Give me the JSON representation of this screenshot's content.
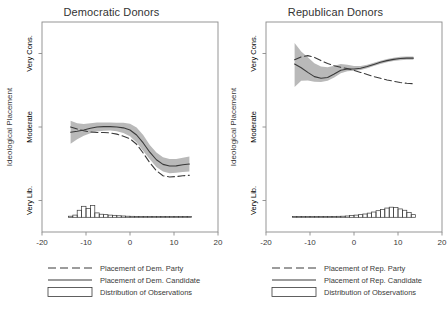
{
  "figure": {
    "background": "#ffffff",
    "band_color": "#b9b9b9",
    "line_color": "#3a3a3a",
    "frame_color": "#8a8a8a"
  },
  "panels": [
    {
      "id": "democratic",
      "title": "Democratic Donors",
      "legend": {
        "party_label": "Placement of Dem. Party",
        "candidate_label": "Placement of Dem. Candidate",
        "distribution_label": "Distribution of Observations"
      }
    },
    {
      "id": "republican",
      "title": "Republican Donors",
      "legend": {
        "party_label": "Placement of Rep. Party",
        "candidate_label": "Placement of Rep. Candidate",
        "distribution_label": "Distribution of Observations"
      }
    }
  ],
  "chart_data": [
    {
      "type": "line",
      "title": "Democratic Donors",
      "xlabel": "",
      "ylabel": "Ideological Placement",
      "xlim": [
        -20,
        20
      ],
      "xticks": [
        -20,
        -10,
        0,
        10,
        20
      ],
      "xticklabels": [
        "-20",
        "-10",
        "0",
        "10",
        "20"
      ],
      "ylim": [
        0,
        100
      ],
      "yticks": [
        85,
        50,
        15
      ],
      "yticklabels": [
        "Very Cons.",
        "Moderate",
        "Very Lib."
      ],
      "grid": false,
      "legend_position": "below",
      "series": [
        {
          "name": "Placement of Dem. Candidate",
          "style": "solid",
          "x": [
            -13.5,
            -12,
            -10.5,
            -9,
            -7.5,
            -6,
            -4.5,
            -3,
            -1.5,
            0,
            1.5,
            3,
            4.5,
            6,
            7.5,
            9,
            10.5,
            12,
            13.5
          ],
          "y": [
            47.5,
            48.0,
            48.6,
            49.4,
            50.0,
            50.2,
            50.2,
            50.0,
            49.6,
            48.6,
            46.2,
            42.4,
            38.0,
            34.4,
            32.2,
            31.4,
            31.5,
            32.0,
            32.4
          ],
          "ci_lower": [
            42.0,
            44.2,
            45.8,
            47.0,
            47.8,
            48.2,
            48.3,
            48.0,
            47.2,
            45.6,
            42.6,
            38.6,
            34.6,
            31.0,
            28.8,
            28.0,
            28.2,
            28.6,
            28.8
          ],
          "ci_upper": [
            53.0,
            51.8,
            51.4,
            51.8,
            52.2,
            52.2,
            52.1,
            52.0,
            52.0,
            51.6,
            49.8,
            46.2,
            41.4,
            37.8,
            35.6,
            34.8,
            34.8,
            35.4,
            36.0
          ]
        },
        {
          "name": "Placement of Dem. Party",
          "style": "dashed",
          "x": [
            -13.5,
            -12,
            -10.5,
            -9,
            -7.5,
            -6,
            -4.5,
            -3,
            -1.5,
            0,
            1.5,
            3,
            4.5,
            6,
            7.5,
            9,
            10.5,
            12,
            13.5
          ],
          "y": [
            50.0,
            49.0,
            48.2,
            47.6,
            47.4,
            47.4,
            47.2,
            46.6,
            45.6,
            44.4,
            41.8,
            37.6,
            33.0,
            29.2,
            26.8,
            26.2,
            26.4,
            26.8,
            27.0
          ]
        }
      ],
      "histogram": {
        "name": "Distribution of Observations",
        "baseline_y": 7,
        "bin_edges": [
          -14,
          -13,
          -12,
          -11,
          -10,
          -9,
          -8,
          -7,
          -6,
          -5,
          -4,
          -3,
          -2,
          -1,
          0,
          1,
          2,
          3,
          4,
          5,
          6,
          7,
          8,
          9,
          10,
          11,
          12,
          13,
          14
        ],
        "counts": [
          0.5,
          1.0,
          3.2,
          5.0,
          4.0,
          5.4,
          2.0,
          1.4,
          1.2,
          1.0,
          0.9,
          0.7,
          0.6,
          0.5,
          0.45,
          0.4,
          0.35,
          0.3,
          0.3,
          0.25,
          0.25,
          0.2,
          0.2,
          0.2,
          0.2,
          0.2,
          0.2,
          0.2
        ]
      }
    },
    {
      "type": "line",
      "title": "Republican Donors",
      "xlabel": "",
      "ylabel": "Ideological Placement",
      "xlim": [
        -20,
        20
      ],
      "xticks": [
        -20,
        -10,
        0,
        10,
        20
      ],
      "xticklabels": [
        "-20",
        "-10",
        "0",
        "10",
        "20"
      ],
      "ylim": [
        0,
        100
      ],
      "yticks": [
        85,
        50,
        15
      ],
      "yticklabels": [
        "Very Cons.",
        "Moderate",
        "Very Lib."
      ],
      "grid": false,
      "legend_position": "below",
      "series": [
        {
          "name": "Placement of Rep. Candidate",
          "style": "solid",
          "x": [
            -13.5,
            -12,
            -10.5,
            -9,
            -7.5,
            -6,
            -4.5,
            -3,
            -1.5,
            0,
            1.5,
            3,
            4.5,
            6,
            7.5,
            9,
            10.5,
            12,
            13.5
          ],
          "y": [
            80.0,
            78.2,
            76.0,
            74.0,
            73.2,
            73.6,
            75.2,
            77.0,
            77.6,
            77.6,
            78.0,
            78.8,
            79.8,
            80.8,
            81.6,
            82.2,
            82.6,
            82.8,
            82.8
          ],
          "ci_lower": [
            69.0,
            72.0,
            72.2,
            71.6,
            71.4,
            72.0,
            73.6,
            75.6,
            76.6,
            76.8,
            77.2,
            78.0,
            79.0,
            80.0,
            80.8,
            81.4,
            81.8,
            82.0,
            82.0
          ],
          "ci_upper": [
            90.0,
            86.0,
            83.2,
            80.4,
            78.8,
            78.4,
            79.2,
            80.0,
            79.6,
            79.0,
            79.0,
            79.6,
            80.6,
            81.6,
            82.4,
            83.0,
            83.4,
            83.6,
            83.6
          ]
        },
        {
          "name": "Placement of Rep. Party",
          "style": "dashed",
          "x": [
            -13.5,
            -12,
            -10.5,
            -9,
            -7.5,
            -6,
            -4.5,
            -3,
            -1.5,
            0,
            1.5,
            3,
            4.5,
            6,
            7.5,
            9,
            10.5,
            12,
            13.5
          ],
          "y": [
            82.0,
            83.4,
            84.0,
            83.2,
            81.6,
            80.2,
            79.2,
            78.4,
            77.8,
            77.0,
            76.0,
            75.0,
            74.0,
            73.2,
            72.4,
            71.8,
            71.2,
            70.8,
            70.6
          ]
        }
      ],
      "histogram": {
        "name": "Distribution of Observations",
        "baseline_y": 7,
        "bin_edges": [
          -14,
          -13,
          -12,
          -11,
          -10,
          -9,
          -8,
          -7,
          -6,
          -5,
          -4,
          -3,
          -2,
          -1,
          0,
          1,
          2,
          3,
          4,
          5,
          6,
          7,
          8,
          9,
          10,
          11,
          12,
          13,
          14
        ],
        "counts": [
          0.2,
          0.2,
          0.2,
          0.2,
          0.25,
          0.25,
          0.3,
          0.3,
          0.35,
          0.4,
          0.45,
          0.5,
          0.6,
          0.8,
          1.0,
          1.2,
          1.5,
          1.9,
          2.4,
          3.0,
          3.6,
          4.2,
          4.6,
          4.4,
          3.8,
          3.2,
          2.2,
          1.2
        ]
      }
    }
  ]
}
